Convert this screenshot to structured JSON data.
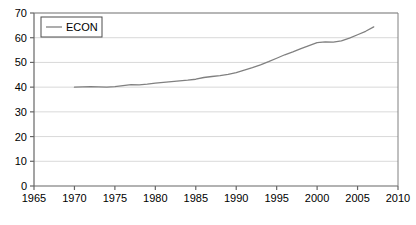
{
  "chart_data": {
    "type": "line",
    "title": "",
    "xlabel": "",
    "ylabel": "",
    "xlim": [
      1965,
      2010
    ],
    "ylim": [
      0,
      70
    ],
    "grid": true,
    "grid_axis": "y",
    "legend_position": "top-left",
    "xticks": [
      1965,
      1970,
      1975,
      1980,
      1985,
      1990,
      1995,
      2000,
      2005,
      2010
    ],
    "xtick_labels": [
      "1965",
      "1970",
      "1975",
      "1980",
      "1985",
      "1990",
      "1995",
      "2000",
      "2005",
      "2010"
    ],
    "yticks": [
      0,
      10,
      20,
      30,
      40,
      50,
      60,
      70
    ],
    "ytick_labels": [
      "0",
      "10",
      "20",
      "30",
      "40",
      "50",
      "60",
      "70"
    ],
    "series": [
      {
        "name": "ECON",
        "color": "#808080",
        "x": [
          1970,
          1971,
          1972,
          1973,
          1974,
          1975,
          1976,
          1977,
          1978,
          1979,
          1980,
          1981,
          1982,
          1983,
          1984,
          1985,
          1986,
          1987,
          1988,
          1989,
          1990,
          1991,
          1992,
          1993,
          1994,
          1995,
          1996,
          1997,
          1998,
          1999,
          2000,
          2001,
          2002,
          2003,
          2004,
          2005,
          2006,
          2007
        ],
        "values": [
          40.0,
          40.1,
          40.2,
          40.1,
          40.0,
          40.2,
          40.6,
          41.0,
          40.9,
          41.2,
          41.6,
          41.9,
          42.2,
          42.5,
          42.8,
          43.2,
          43.9,
          44.3,
          44.7,
          45.2,
          45.9,
          46.9,
          47.9,
          49.0,
          50.3,
          51.7,
          53.1,
          54.3,
          55.6,
          56.8,
          58.0,
          58.3,
          58.2,
          58.7,
          59.8,
          61.2,
          62.6,
          64.4
        ]
      }
    ]
  },
  "legend": {
    "entries": [
      {
        "label": "ECON",
        "color": "#808080"
      }
    ]
  },
  "axes": {
    "frame_color": "#666666",
    "grid_color": "#d9d9d9",
    "tick_color": "#666666"
  }
}
